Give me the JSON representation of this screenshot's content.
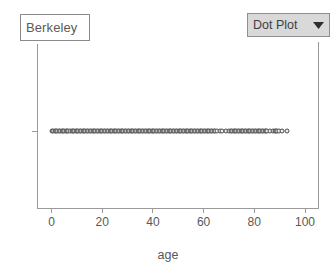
{
  "legend": {
    "collection_label": "Berkeley"
  },
  "plot_type_menu": {
    "selected": "Dot Plot",
    "caret_icon": "chevron-down-icon"
  },
  "axis_title": "age",
  "chart_data": {
    "type": "scatter",
    "title": "",
    "subtitle": "",
    "xlabel": "age",
    "ylabel": "",
    "xlim": [
      -5,
      105
    ],
    "ylim": [
      0,
      1
    ],
    "grid": false,
    "legend_position": "top-left",
    "legend_entries": [
      "Berkeley"
    ],
    "xticks": [
      0,
      20,
      40,
      60,
      80,
      100
    ],
    "xticklabels": [
      "0",
      "20",
      "40",
      "60",
      "80",
      "100"
    ],
    "yticks": [],
    "yticklabels": [],
    "marker": "open-circle",
    "marker_color": "#4a4a4a",
    "marker_fill": "#efefef",
    "series": [
      {
        "name": "age",
        "y_value": 0.5,
        "values": [
          0,
          0.6,
          1.2,
          1.8,
          2.3,
          2.9,
          3.4,
          4.0,
          4.5,
          5.1,
          5.6,
          6.2,
          6.7,
          7.3,
          7.9,
          8.4,
          9.0,
          9.5,
          10.1,
          10.6,
          11.2,
          11.7,
          12.3,
          12.9,
          13.4,
          14.0,
          14.5,
          15.1,
          15.6,
          16.2,
          16.7,
          17.3,
          17.9,
          18.4,
          19.0,
          19.5,
          20.1,
          20.6,
          21.2,
          21.7,
          22.3,
          22.9,
          23.4,
          24.0,
          24.5,
          25.1,
          25.6,
          26.2,
          26.7,
          27.3,
          27.9,
          28.4,
          29.0,
          29.5,
          30.1,
          30.6,
          31.2,
          31.7,
          32.3,
          32.9,
          33.4,
          34.0,
          34.5,
          35.1,
          35.6,
          36.2,
          36.7,
          37.3,
          37.9,
          38.4,
          39.0,
          39.5,
          40.1,
          40.6,
          41.2,
          41.7,
          42.3,
          42.9,
          43.4,
          44.0,
          44.5,
          45.1,
          45.6,
          46.2,
          46.7,
          47.3,
          47.9,
          48.4,
          49.0,
          49.5,
          50.1,
          50.6,
          51.2,
          51.7,
          52.3,
          52.9,
          53.4,
          54.0,
          54.5,
          55.1,
          55.6,
          56.2,
          56.7,
          57.3,
          57.9,
          58.4,
          59.0,
          59.5,
          60.1,
          60.6,
          61.2,
          61.7,
          62.3,
          62.9,
          63.4,
          64.0,
          64.5,
          65.1,
          66.3,
          67.4,
          69.0,
          70.1,
          70.7,
          71.3,
          71.8,
          72.4,
          72.9,
          73.5,
          74.0,
          74.6,
          75.2,
          75.7,
          76.3,
          76.8,
          77.4,
          77.9,
          78.5,
          79.1,
          79.6,
          80.2,
          80.7,
          81.3,
          81.8,
          82.4,
          83.0,
          83.5,
          84.1,
          84.6,
          85.2,
          86.3,
          87.4,
          88.0,
          88.6,
          89.1,
          89.7,
          91.0,
          93.0
        ]
      }
    ]
  }
}
